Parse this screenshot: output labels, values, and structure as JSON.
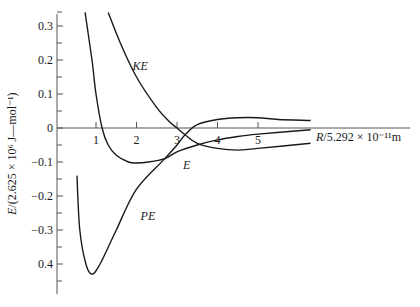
{
  "chart_data": {
    "type": "line",
    "title": "",
    "xlabel": "R/5.292 × 10⁻¹¹m",
    "ylabel": "E/(2.625 × 10⁶ J—mol⁻¹)",
    "xlim": [
      0,
      8.9
    ],
    "ylim": [
      -0.49,
      0.34
    ],
    "grid": false,
    "legend": "inline curve labels",
    "x_ticks": [
      "1",
      "2",
      "3",
      "4",
      "5"
    ],
    "x_tick_values": [
      1,
      2,
      3,
      4,
      5
    ],
    "y_ticks": [
      "0.3",
      "0.2",
      "0.1",
      "0",
      "−0.1",
      "−0.2",
      "−0.3",
      "0.4"
    ],
    "y_tick_values": [
      0.3,
      0.2,
      0.1,
      0,
      -0.1,
      -0.2,
      -0.3,
      -0.4
    ],
    "series": [
      {
        "name": "E",
        "label": "E",
        "points": [
          [
            0.73,
            0.34
          ],
          [
            0.9,
            0.2
          ],
          [
            1.0,
            0.1
          ],
          [
            1.15,
            0.0
          ],
          [
            1.3,
            -0.05
          ],
          [
            1.5,
            -0.08
          ],
          [
            1.8,
            -0.1
          ],
          [
            2.0,
            -0.103
          ],
          [
            2.3,
            -0.1
          ],
          [
            2.7,
            -0.09
          ],
          [
            3.0,
            -0.07
          ],
          [
            3.5,
            -0.05
          ],
          [
            4.0,
            -0.035
          ],
          [
            4.5,
            -0.025
          ],
          [
            5.0,
            -0.018
          ],
          [
            6.3,
            -0.005
          ]
        ]
      },
      {
        "name": "KE",
        "label": "KE",
        "points": [
          [
            1.3,
            0.34
          ],
          [
            1.6,
            0.25
          ],
          [
            2.0,
            0.15
          ],
          [
            2.5,
            0.06
          ],
          [
            2.8,
            0.02
          ],
          [
            3.0,
            0.0
          ],
          [
            3.2,
            -0.02
          ],
          [
            3.5,
            -0.045
          ],
          [
            4.0,
            -0.06
          ],
          [
            4.5,
            -0.065
          ],
          [
            5.0,
            -0.06
          ],
          [
            6.3,
            -0.045
          ]
        ]
      },
      {
        "name": "PE",
        "label": "PE",
        "points": [
          [
            0.53,
            -0.14
          ],
          [
            0.6,
            -0.3
          ],
          [
            0.75,
            -0.4
          ],
          [
            0.9,
            -0.43
          ],
          [
            1.1,
            -0.4
          ],
          [
            1.5,
            -0.3
          ],
          [
            2.0,
            -0.18
          ],
          [
            2.7,
            -0.09
          ],
          [
            3.0,
            -0.05
          ],
          [
            3.2,
            -0.02
          ],
          [
            3.5,
            0.01
          ],
          [
            4.0,
            0.025
          ],
          [
            4.5,
            0.03
          ],
          [
            5.0,
            0.03
          ],
          [
            5.5,
            0.025
          ],
          [
            6.3,
            0.022
          ]
        ]
      }
    ],
    "annotations": [
      {
        "text": "KE",
        "x": 1.9,
        "y": 0.17
      },
      {
        "text": "E",
        "x": 3.15,
        "y": -0.12
      },
      {
        "text": "PE",
        "x": 2.1,
        "y": -0.27
      }
    ]
  }
}
